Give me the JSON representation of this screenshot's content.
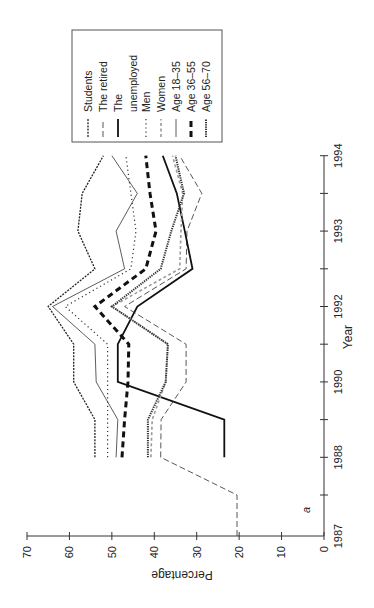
{
  "chart_data": {
    "type": "line",
    "orientation": "rotated 90 degrees counterclockwise (Year axis vertical on right, Percentage axis horizontal at bottom)",
    "title": "",
    "panel_label": "a",
    "xlabel": "Year",
    "ylabel": "Percentage",
    "ylim": [
      0,
      70
    ],
    "y_ticks": [
      0,
      10,
      20,
      30,
      40,
      50,
      60,
      70
    ],
    "x_tick_positions": [
      0,
      1,
      2,
      3,
      4,
      5,
      6,
      7,
      8,
      9,
      10
    ],
    "x_tick_labels": [
      "1987",
      "",
      "1988",
      "",
      "1990",
      "",
      "1992",
      "",
      "1993",
      "",
      "1994"
    ],
    "grid": false,
    "legend_position": "top-right (rotated)",
    "series": [
      {
        "name": "Students",
        "style": "dotted-dense",
        "color": "#222222",
        "x": [
          2,
          3,
          4,
          5,
          6,
          7,
          8,
          9,
          10
        ],
        "values": [
          54,
          54,
          59,
          59,
          65,
          54,
          58,
          57,
          52
        ]
      },
      {
        "name": "The retired",
        "style": "long-dash",
        "color": "#444444",
        "x": [
          0,
          1,
          2,
          3,
          4,
          5,
          6,
          7,
          8,
          9,
          10
        ],
        "values": [
          20.5,
          20.5,
          38.5,
          38.4,
          32.5,
          32.5,
          47,
          32.5,
          32.3,
          28.8,
          34
        ]
      },
      {
        "name": "The unemployed",
        "style": "solid-thick",
        "color": "#111111",
        "x": [
          2,
          3,
          4,
          5,
          6,
          7,
          8,
          9,
          10
        ],
        "values": [
          23.5,
          23.5,
          48.6,
          48.6,
          44,
          31,
          32.8,
          34.7,
          38
        ]
      },
      {
        "name": "Men",
        "style": "dotted-sparse",
        "color": "#333333",
        "x": [
          2,
          3,
          4,
          5,
          6,
          7,
          8,
          9,
          10
        ],
        "values": [
          51,
          51,
          51,
          51,
          61,
          45.5,
          44.3,
          45.5,
          46.7
        ]
      },
      {
        "name": "Women",
        "style": "dash-gray",
        "color": "#9a9a9a",
        "x": [
          2,
          3,
          4,
          5,
          6,
          7,
          8,
          9,
          10
        ],
        "values": [
          40.8,
          40.5,
          37.3,
          36.8,
          50,
          34,
          33.7,
          33.3,
          35.7
        ]
      },
      {
        "name": "Age 18–35",
        "style": "solid-thin",
        "color": "#333333",
        "x": [
          2,
          3,
          4,
          5,
          6,
          7,
          8,
          9,
          10
        ],
        "values": [
          49,
          48.6,
          53.7,
          54,
          64,
          47,
          49,
          44,
          50
        ]
      },
      {
        "name": "Age 36–55",
        "style": "dash-thick",
        "color": "#111111",
        "x": [
          2,
          3,
          4,
          5,
          6,
          7,
          8,
          9,
          10
        ],
        "values": [
          47.6,
          47,
          46.2,
          46,
          54,
          42,
          39.6,
          41,
          42
        ]
      },
      {
        "name": "Age 56–70",
        "style": "dotted-thick",
        "color": "#333333",
        "x": [
          2,
          3,
          4,
          5,
          6,
          7,
          8,
          9,
          10
        ],
        "values": [
          41.5,
          41.5,
          37.3,
          36.8,
          50,
          38.5,
          36,
          33,
          35
        ]
      }
    ]
  },
  "legend": {
    "items": [
      "Students",
      "The retired",
      "The",
      "unemployed",
      "Men",
      "Women",
      "Age 18–35",
      "Age 36–55",
      "Age 56–70"
    ]
  }
}
